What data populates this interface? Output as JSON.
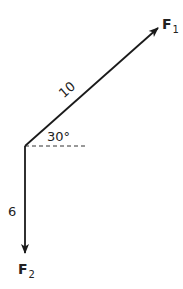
{
  "diagram": {
    "type": "force-vectors",
    "vectors": [
      {
        "name": "F",
        "subscript": "1",
        "magnitude_label": "10",
        "direction_deg": 30
      },
      {
        "name": "F",
        "subscript": "2",
        "magnitude_label": "6",
        "direction_deg": -90
      }
    ],
    "angle_label": "30°",
    "colors": {
      "stroke": "#1a1a1a",
      "dashed": "#333333",
      "text": "#222222"
    }
  }
}
